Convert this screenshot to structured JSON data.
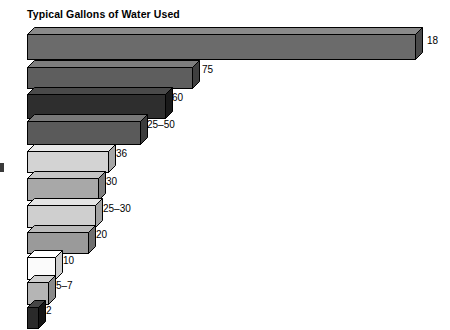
{
  "chart": {
    "title": "Typical Gallons of Water Used"
  },
  "chart_data": {
    "type": "bar",
    "orientation": "horizontal",
    "title": "Typical Gallons of Water Used",
    "xlabel": "",
    "ylabel": "",
    "categories": [
      "",
      "",
      "",
      "",
      "",
      "",
      "",
      "",
      "",
      "",
      ""
    ],
    "value_labels": [
      "18",
      "75",
      "60",
      "25–50",
      "36",
      "30",
      "25–30",
      "20",
      "10",
      "5–7",
      "2"
    ],
    "values": [
      180,
      75,
      60,
      37.5,
      36,
      30,
      27.5,
      20,
      10,
      6,
      2
    ],
    "bar_pixel_lengths": [
      388,
      165,
      138,
      113,
      81,
      71,
      68,
      61,
      28,
      21,
      11
    ],
    "bar_colors": [
      "#6b6b6b",
      "#5e5e5e",
      "#2e2e2e",
      "#5a5a5a",
      "#d3d3d3",
      "#a8a8a8",
      "#cfcfcf",
      "#9a9a9a",
      "#fbfbfb",
      "#b5b5b5",
      "#2a2a2a"
    ],
    "bar_top_colors": [
      "#8a8a8a",
      "#7d7d7d",
      "#4a4a4a",
      "#787878",
      "#e8e8e8",
      "#c4c4c4",
      "#e4e4e4",
      "#bababa",
      "#ffffff",
      "#d0d0d0",
      "#454545"
    ],
    "bar_side_colors": [
      "#4a4a4a",
      "#3f3f3f",
      "#1a1a1a",
      "#3c3c3c",
      "#a6a6a6",
      "#7d7d7d",
      "#a2a2a2",
      "#6f6f6f",
      "#cdcdcd",
      "#8a8a8a",
      "#151515"
    ],
    "grid": false,
    "legend": null,
    "axis_ranges": {
      "x": [
        0,
        180
      ],
      "y": null
    }
  },
  "bars": [
    {
      "label": "18",
      "length": 388,
      "y": 27,
      "height": 25,
      "face": "#6b6b6b",
      "top": "#8a8a8a",
      "side": "#4a4a4a",
      "label_x": 427,
      "label_y": 44
    },
    {
      "label": "75",
      "length": 165,
      "y": 60,
      "height": 21,
      "face": "#5e5e5e",
      "top": "#7d7d7d",
      "side": "#3f3f3f",
      "label_x": 202,
      "label_y": 73
    },
    {
      "label": "60",
      "length": 138,
      "y": 87,
      "height": 24,
      "face": "#2e2e2e",
      "top": "#4a4a4a",
      "side": "#1a1a1a",
      "label_x": 172,
      "label_y": 101
    },
    {
      "label": "25–50",
      "length": 113,
      "y": 114,
      "height": 23,
      "face": "#5a5a5a",
      "top": "#787878",
      "side": "#3c3c3c",
      "label_x": 147,
      "label_y": 128
    },
    {
      "label": "36",
      "length": 81,
      "y": 144,
      "height": 21,
      "face": "#d3d3d3",
      "top": "#e8e8e8",
      "side": "#a6a6a6",
      "label_x": 116,
      "label_y": 157
    },
    {
      "label": "30",
      "length": 71,
      "y": 171,
      "height": 22,
      "face": "#a8a8a8",
      "top": "#c4c4c4",
      "side": "#7d7d7d",
      "label_x": 106,
      "label_y": 185
    },
    {
      "label": "25–30",
      "length": 68,
      "y": 198,
      "height": 22,
      "face": "#cfcfcf",
      "top": "#e4e4e4",
      "side": "#a2a2a2",
      "label_x": 103,
      "label_y": 212
    },
    {
      "label": "20",
      "length": 61,
      "y": 225,
      "height": 21,
      "face": "#9a9a9a",
      "top": "#bababa",
      "side": "#6f6f6f",
      "label_x": 96,
      "label_y": 238
    },
    {
      "label": "10",
      "length": 28,
      "y": 250,
      "height": 22,
      "face": "#fbfbfb",
      "top": "#ffffff",
      "side": "#cdcdcd",
      "label_x": 63,
      "label_y": 264
    },
    {
      "label": "5–7",
      "length": 21,
      "y": 275,
      "height": 22,
      "face": "#b5b5b5",
      "top": "#d0d0d0",
      "side": "#8a8a8a",
      "label_x": 56,
      "label_y": 289
    },
    {
      "label": "2",
      "length": 11,
      "y": 300,
      "height": 21,
      "face": "#2a2a2a",
      "top": "#454545",
      "side": "#151515",
      "label_x": 46,
      "label_y": 314
    }
  ],
  "layout": {
    "bar_origin_x": 27,
    "depth_x": 7,
    "depth_y": 7
  }
}
